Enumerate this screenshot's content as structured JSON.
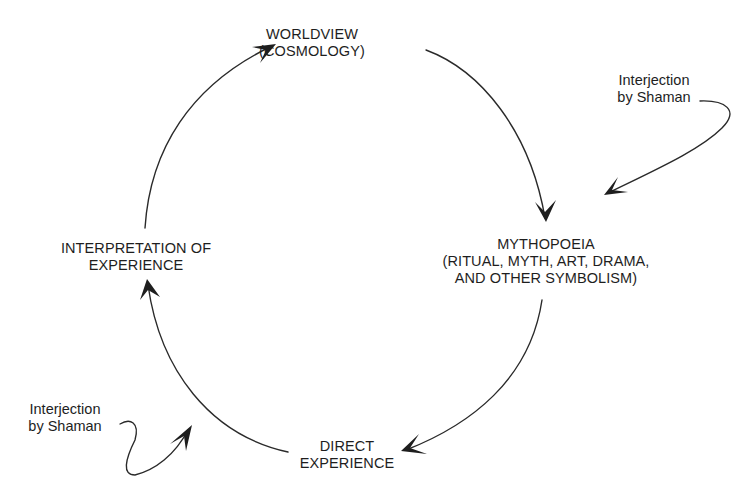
{
  "diagram": {
    "type": "cycle",
    "nodes": [
      {
        "id": "worldview",
        "lines": [
          "WORLDVIEW",
          "(COSMOLOGY)"
        ]
      },
      {
        "id": "mythopoeia",
        "lines": [
          "MYTHOPOEIA",
          "(RITUAL, MYTH, ART, DRAMA,",
          "AND OTHER SYMBOLISM)"
        ]
      },
      {
        "id": "direct_experience",
        "lines": [
          "DIRECT",
          "EXPERIENCE"
        ]
      },
      {
        "id": "interpretation",
        "lines": [
          "INTERPRETATION OF",
          "EXPERIENCE"
        ]
      }
    ],
    "edges": [
      {
        "from": "worldview",
        "to": "mythopoeia"
      },
      {
        "from": "mythopoeia",
        "to": "direct_experience"
      },
      {
        "from": "direct_experience",
        "to": "interpretation"
      },
      {
        "from": "interpretation",
        "to": "worldview"
      }
    ],
    "interjections": [
      {
        "id": "top_right",
        "lines": [
          "Interjection",
          "by Shaman"
        ],
        "target_edge": "worldview->mythopoeia"
      },
      {
        "id": "bottom_left",
        "lines": [
          "Interjection",
          "by Shaman"
        ],
        "target_edge": "direct_experience->interpretation"
      }
    ],
    "line_color": "#2a2a2a",
    "text_color": "#1e1e1e"
  }
}
